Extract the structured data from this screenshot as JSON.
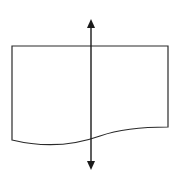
{
  "diagram": {
    "shape": "document-wave",
    "line_color": "#2a2a2a",
    "background": "#ffffff",
    "arrow": {
      "type": "double-headed-vertical",
      "x": 91,
      "y_top": 19,
      "y_bottom": 170
    }
  }
}
